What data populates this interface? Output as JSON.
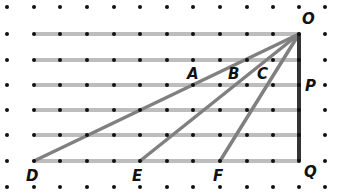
{
  "diagram": {
    "type": "geometry-dot-grid",
    "colors": {
      "dot": "#111111",
      "grid_line": "#bdbdbd",
      "ray": "#808080",
      "vertical": "#333333",
      "label": "#111111"
    },
    "grid": {
      "columns_x": [
        7,
        34,
        60,
        87,
        114,
        140,
        167,
        193,
        220,
        247,
        273,
        299,
        325
      ],
      "rows_y": [
        7,
        34,
        60,
        85,
        110,
        135,
        161,
        187
      ]
    },
    "horizontal_lines_y": [
      34,
      60,
      85,
      110,
      135,
      161
    ],
    "points": {
      "O": {
        "label": "O",
        "x": 299,
        "y": 34
      },
      "P": {
        "label": "P",
        "x": 299,
        "y": 85
      },
      "Q": {
        "label": "Q",
        "x": 299,
        "y": 161
      },
      "D": {
        "label": "D",
        "x": 34,
        "y": 161
      },
      "E": {
        "label": "E",
        "x": 140,
        "y": 161
      },
      "F": {
        "label": "F",
        "x": 220,
        "y": 161
      },
      "A": {
        "label": "A"
      },
      "B": {
        "label": "B"
      },
      "C": {
        "label": "C"
      }
    },
    "segments": [
      "OD",
      "OE",
      "OF",
      "OQ"
    ]
  }
}
